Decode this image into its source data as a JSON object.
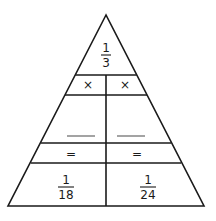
{
  "diagram": {
    "type": "fraction-multiplication-triangle",
    "top": {
      "numerator": "1",
      "denominator": "3"
    },
    "operators": {
      "left": "×",
      "right": "×"
    },
    "blanks": {
      "left": "",
      "right": ""
    },
    "equals": {
      "left": "=",
      "right": "="
    },
    "results": {
      "left": {
        "numerator": "1",
        "denominator": "18"
      },
      "right": {
        "numerator": "1",
        "denominator": "24"
      }
    },
    "line_color": "#1a1a1a"
  }
}
